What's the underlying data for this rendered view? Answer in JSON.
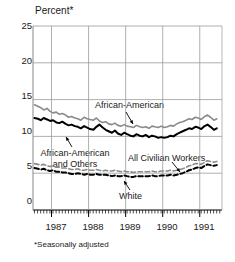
{
  "chart_data": {
    "type": "line",
    "title": "",
    "ylabel": "Percent*",
    "xlabel": "",
    "ylim": [
      0,
      25
    ],
    "yticks": [
      0,
      5,
      10,
      15,
      20,
      25
    ],
    "xticks": [
      "1987",
      "1988",
      "1989",
      "1990",
      "1991"
    ],
    "xlim": [
      1986.5,
      1991.6
    ],
    "grid": "horizontal",
    "legend": "inline-annotations",
    "footnote": "*Seasonally adjusted",
    "annotations": [
      {
        "text": "African-American",
        "series": "African-American"
      },
      {
        "text": "African-American and Others",
        "series": "African-American and Others"
      },
      {
        "text": "All Civilian Workers",
        "series": "All Civilian Workers"
      },
      {
        "text": "White",
        "series": "White"
      }
    ],
    "x": [
      1986.54,
      1986.63,
      1986.71,
      1986.79,
      1986.88,
      1986.96,
      1987.04,
      1987.13,
      1987.21,
      1987.29,
      1987.38,
      1987.46,
      1987.54,
      1987.63,
      1987.71,
      1987.79,
      1987.88,
      1987.96,
      1988.04,
      1988.13,
      1988.21,
      1988.29,
      1988.38,
      1988.46,
      1988.54,
      1988.63,
      1988.71,
      1988.79,
      1988.88,
      1988.96,
      1989.04,
      1989.13,
      1989.21,
      1989.29,
      1989.38,
      1989.46,
      1989.54,
      1989.63,
      1989.71,
      1989.79,
      1989.88,
      1989.96,
      1990.04,
      1990.13,
      1990.21,
      1990.29,
      1990.38,
      1990.46,
      1990.54,
      1990.63,
      1990.71,
      1990.79,
      1990.88,
      1990.96,
      1991.04,
      1991.13,
      1991.21,
      1991.29,
      1991.38,
      1991.46
    ],
    "series": [
      {
        "name": "African-American",
        "color": "#8a8a8a",
        "style": "solid",
        "width": 1.6,
        "values": [
          14.3,
          14.1,
          13.9,
          13.6,
          13.8,
          13.4,
          13.2,
          13.3,
          13.0,
          13.1,
          12.9,
          12.6,
          12.7,
          12.5,
          12.4,
          12.2,
          12.6,
          12.4,
          12.3,
          12.2,
          12.5,
          12.1,
          11.9,
          12.0,
          11.7,
          11.6,
          11.8,
          11.5,
          11.4,
          11.6,
          11.4,
          11.3,
          11.2,
          11.5,
          11.3,
          11.2,
          11.3,
          11.1,
          11.4,
          11.3,
          11.2,
          11.4,
          11.2,
          11.3,
          11.5,
          11.4,
          11.7,
          11.9,
          12.0,
          12.2,
          12.4,
          12.3,
          12.6,
          12.5,
          12.3,
          12.7,
          12.9,
          12.6,
          12.2,
          12.4
        ]
      },
      {
        "name": "African-American and Others",
        "color": "#000000",
        "style": "solid",
        "width": 2.0,
        "values": [
          12.5,
          12.4,
          12.2,
          12.5,
          12.3,
          12.1,
          12.2,
          11.9,
          11.8,
          12.0,
          11.7,
          11.5,
          11.6,
          11.4,
          11.3,
          11.1,
          11.4,
          11.2,
          11.0,
          10.9,
          11.3,
          11.6,
          11.2,
          10.9,
          10.7,
          10.5,
          10.8,
          10.4,
          10.2,
          10.5,
          10.3,
          10.1,
          10.0,
          10.3,
          10.1,
          10.0,
          10.2,
          9.9,
          10.1,
          10.0,
          9.8,
          9.9,
          9.8,
          9.9,
          10.1,
          10.0,
          10.3,
          10.5,
          10.7,
          10.9,
          11.1,
          11.0,
          11.3,
          11.2,
          11.0,
          11.4,
          11.6,
          11.3,
          10.9,
          11.1
        ]
      },
      {
        "name": "All Civilian Workers",
        "color": "#8a8a8a",
        "style": "dashed",
        "width": 1.6,
        "values": [
          6.3,
          6.2,
          6.1,
          6.2,
          6.0,
          5.9,
          6.0,
          5.8,
          5.8,
          5.7,
          5.7,
          5.6,
          5.5,
          5.5,
          5.6,
          5.4,
          5.4,
          5.5,
          5.4,
          5.4,
          5.5,
          5.4,
          5.3,
          5.4,
          5.3,
          5.3,
          5.4,
          5.3,
          5.2,
          5.3,
          5.2,
          5.2,
          5.1,
          5.2,
          5.2,
          5.2,
          5.2,
          5.2,
          5.3,
          5.2,
          5.2,
          5.3,
          5.3,
          5.3,
          5.4,
          5.3,
          5.4,
          5.5,
          5.6,
          5.8,
          6.0,
          6.1,
          6.3,
          6.3,
          6.2,
          6.5,
          6.7,
          6.6,
          6.5,
          6.6
        ]
      },
      {
        "name": "White",
        "color": "#000000",
        "style": "dashed",
        "width": 2.0,
        "values": [
          5.7,
          5.6,
          5.5,
          5.6,
          5.4,
          5.3,
          5.4,
          5.2,
          5.2,
          5.1,
          5.1,
          5.0,
          4.9,
          4.9,
          5.0,
          4.9,
          4.8,
          4.9,
          4.8,
          4.8,
          4.9,
          4.8,
          4.8,
          4.8,
          4.7,
          4.6,
          4.7,
          4.6,
          4.6,
          4.7,
          4.6,
          4.5,
          4.5,
          4.6,
          4.6,
          4.6,
          4.6,
          4.6,
          4.7,
          4.6,
          4.6,
          4.7,
          4.7,
          4.7,
          4.8,
          4.7,
          4.8,
          4.9,
          5.0,
          5.2,
          5.4,
          5.5,
          5.7,
          5.8,
          5.7,
          6.0,
          6.2,
          6.1,
          6.0,
          6.1
        ]
      }
    ]
  },
  "axis": {
    "title": "Percent*",
    "y_ticks": [
      "25",
      "20",
      "15",
      "10",
      "5",
      "0"
    ],
    "x_ticks": [
      "1987",
      "1988",
      "1989",
      "1990",
      "1991"
    ]
  },
  "labels": {
    "african_american": "African-American",
    "african_american_others_line1": "African-American",
    "african_american_others_line2": "and Others",
    "all_civilian_workers": "All Civilian Workers",
    "white": "White"
  },
  "footnote": "*Seasonally adjusted"
}
